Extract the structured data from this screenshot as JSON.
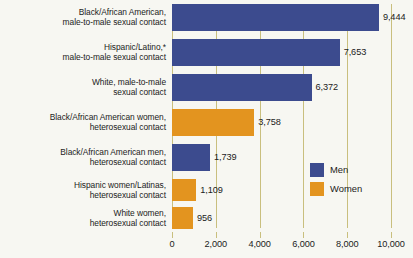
{
  "chart_data": {
    "type": "bar",
    "orientation": "horizontal",
    "title": "",
    "xlabel": "",
    "ylabel": "",
    "xlim": [
      0,
      11000
    ],
    "xticks": [
      0,
      2000,
      4000,
      6000,
      8000,
      10000
    ],
    "xtick_labels": [
      "0",
      "2,000",
      "4,000",
      "6,000",
      "8,000",
      "10,000"
    ],
    "grid": true,
    "legend_position": "center-right",
    "categories": [
      "Black/African American,\nmale-to-male sexual contact",
      "Hispanic/Latino,*\nmale-to-male sexual contact",
      "White, male-to-male\nsexual contact",
      "Black/African American women,\nheterosexual contact",
      "Black/African American men,\nheterosexual contact",
      "Hispanic women/Latinas,\nheterosexual contact",
      "White women,\nheterosexual contact"
    ],
    "values": [
      9444,
      7653,
      6372,
      3758,
      1739,
      1109,
      956
    ],
    "value_labels": [
      "9,444",
      "7,653",
      "6,372",
      "3,758",
      "1,739",
      "1,109",
      "956"
    ],
    "groups": [
      "Men",
      "Men",
      "Men",
      "Women",
      "Men",
      "Women",
      "Women"
    ],
    "series": [
      {
        "name": "Men",
        "color": "#3c4b8e",
        "values": [
          9444,
          7653,
          6372,
          null,
          1739,
          null,
          null
        ]
      },
      {
        "name": "Women",
        "color": "#e3941f",
        "values": [
          null,
          null,
          null,
          3758,
          null,
          1109,
          956
        ]
      }
    ],
    "legend": [
      {
        "label": "Men",
        "color": "#3c4b8e"
      },
      {
        "label": "Women",
        "color": "#e3941f"
      }
    ]
  },
  "colors": {
    "men": "#3c4b8e",
    "women": "#e3941f",
    "gridline": "#c9bf7e",
    "background": "#f7f7f2",
    "text": "#1b1b1b"
  }
}
